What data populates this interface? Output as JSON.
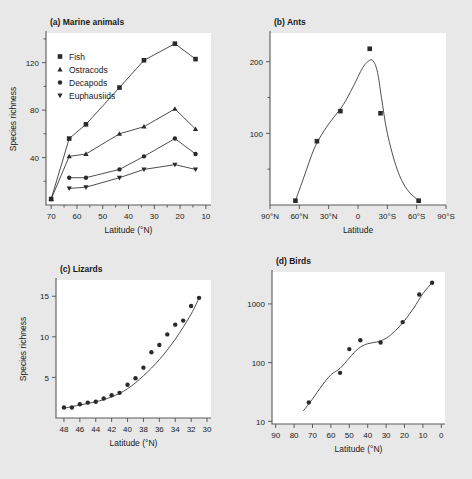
{
  "figure": {
    "background_color": "#e8e8e8",
    "plot_background_color": "#ffffff",
    "axis_color": "#5a5a5a",
    "marker_color": "#2a2a2a"
  },
  "chart_data": [
    {
      "id": "marine-animals",
      "type": "line",
      "title": "(a) Marine animals",
      "xlabel": "Latitude (°N)",
      "ylabel": "Species richness",
      "xlim": [
        72,
        8
      ],
      "ylim": [
        0,
        145
      ],
      "x_reversed": true,
      "xticks": [
        70,
        60,
        50,
        40,
        30,
        20,
        10
      ],
      "xtick_labels": [
        "70",
        "60",
        "50",
        "40",
        "30",
        "20",
        "10"
      ],
      "x_minor_ticks": [
        65,
        55,
        45,
        35,
        25,
        15
      ],
      "yticks": [
        40,
        80,
        120
      ],
      "ytick_labels": [
        "40",
        "80",
        "120"
      ],
      "y_minor_ticks": [
        20,
        60,
        100,
        140
      ],
      "grid": false,
      "legend_position": "top-left",
      "series": [
        {
          "name": "Fish",
          "marker": "square",
          "x": [
            70,
            63,
            56.5,
            43.5,
            34,
            22,
            14
          ],
          "values": [
            5,
            56,
            68,
            99,
            122,
            136,
            123
          ]
        },
        {
          "name": "Ostracods",
          "marker": "triangle",
          "x": [
            70,
            63,
            56.5,
            43.5,
            34,
            22,
            14
          ],
          "values": [
            5,
            41,
            43,
            60,
            66,
            81,
            64
          ]
        },
        {
          "name": "Decapods",
          "marker": "circle",
          "x": [
            63,
            56.5,
            43.5,
            34,
            22,
            14
          ],
          "values": [
            23,
            23,
            30,
            41,
            56,
            43
          ]
        },
        {
          "name": "Euphausiids",
          "marker": "inverted-triangle",
          "x": [
            63,
            56.5,
            43.5,
            34,
            22,
            14
          ],
          "values": [
            14,
            15,
            23,
            30,
            34,
            30
          ]
        }
      ]
    },
    {
      "id": "ants",
      "type": "line",
      "title": "(b) Ants",
      "xlabel": "Latitude",
      "ylabel": "",
      "xlim": [
        90,
        -90
      ],
      "ylim": [
        0,
        240
      ],
      "x_reversed": true,
      "xticks": [
        90,
        60,
        30,
        0,
        -30,
        -60,
        -90
      ],
      "xtick_labels": [
        "90°N",
        "60°N",
        "30°N",
        "0",
        "30°S",
        "60°S",
        "90°S"
      ],
      "yticks": [
        100,
        200
      ],
      "ytick_labels": [
        "100",
        "200"
      ],
      "y_minor_ticks": [
        50,
        150
      ],
      "grid": false,
      "series": [
        {
          "name": "Ants",
          "marker": "square",
          "x": [
            64,
            42,
            18,
            -12,
            -23,
            -62
          ],
          "values": [
            6,
            89,
            131,
            218,
            128,
            6
          ]
        }
      ],
      "fitted_curve": {
        "x": [
          64,
          55,
          45,
          35,
          25,
          15,
          5,
          -5,
          -12,
          -16,
          -20,
          -24,
          -30,
          -40,
          -50,
          -62
        ],
        "values": [
          6,
          40,
          78,
          103,
          122,
          140,
          165,
          192,
          202,
          200,
          185,
          150,
          100,
          50,
          22,
          6
        ]
      }
    },
    {
      "id": "lizards",
      "type": "scatter",
      "title": "(c) Lizards",
      "xlabel": "Latitude (°N)",
      "ylabel": "Species richness",
      "xlim": [
        49,
        29.5
      ],
      "ylim": [
        0,
        17
      ],
      "x_reversed": true,
      "xticks": [
        48,
        46,
        44,
        42,
        40,
        38,
        36,
        34,
        32,
        30
      ],
      "xtick_labels": [
        "48",
        "46",
        "44",
        "42",
        "40",
        "38",
        "36",
        "34",
        "32",
        "30"
      ],
      "yticks": [
        5,
        10,
        15
      ],
      "ytick_labels": [
        "5",
        "10",
        "15"
      ],
      "grid": false,
      "series": [
        {
          "name": "Lizards",
          "marker": "circle",
          "x": [
            48,
            47,
            46,
            45,
            44,
            43,
            42,
            41,
            40,
            39,
            38,
            37,
            36,
            35,
            34,
            33,
            32,
            31
          ],
          "values": [
            1.3,
            1.3,
            1.7,
            1.9,
            2.0,
            2.4,
            2.8,
            3.1,
            4.1,
            4.9,
            6.2,
            8.1,
            9.0,
            10.3,
            11.5,
            12.0,
            13.8,
            14.8
          ]
        }
      ],
      "fitted_curve": {
        "x": [
          48,
          46,
          44,
          42,
          40,
          38,
          36,
          34,
          32,
          31
        ],
        "values": [
          1.2,
          1.6,
          2.0,
          2.6,
          3.6,
          5.2,
          7.2,
          9.7,
          12.8,
          14.8
        ]
      }
    },
    {
      "id": "birds",
      "type": "scatter",
      "title": "(d) Birds",
      "xlabel": "Latitude (°N)",
      "ylabel": "",
      "xlim": [
        92,
        -2
      ],
      "ylim": [
        9,
        3500
      ],
      "y_scale": "log",
      "x_reversed": true,
      "xticks": [
        90,
        80,
        70,
        60,
        50,
        40,
        30,
        20,
        10,
        0
      ],
      "xtick_labels": [
        "90",
        "80",
        "70",
        "60",
        "50",
        "40",
        "30",
        "20",
        "10",
        "0"
      ],
      "yticks": [
        10,
        100,
        1000
      ],
      "ytick_labels": [
        "10",
        "100",
        "1000"
      ],
      "grid": false,
      "series": [
        {
          "name": "Birds",
          "marker": "circle",
          "x": [
            72,
            55,
            50,
            44,
            33,
            21,
            12,
            5
          ],
          "values": [
            21,
            67,
            170,
            240,
            220,
            490,
            1450,
            2300
          ]
        }
      ],
      "fitted_curve": {
        "x": [
          75,
          70,
          65,
          60,
          55,
          50,
          45,
          40,
          35,
          30,
          25,
          20,
          15,
          10,
          5
        ],
        "values": [
          15,
          24,
          40,
          62,
          80,
          120,
          175,
          210,
          225,
          260,
          350,
          520,
          850,
          1500,
          2300
        ]
      }
    }
  ]
}
